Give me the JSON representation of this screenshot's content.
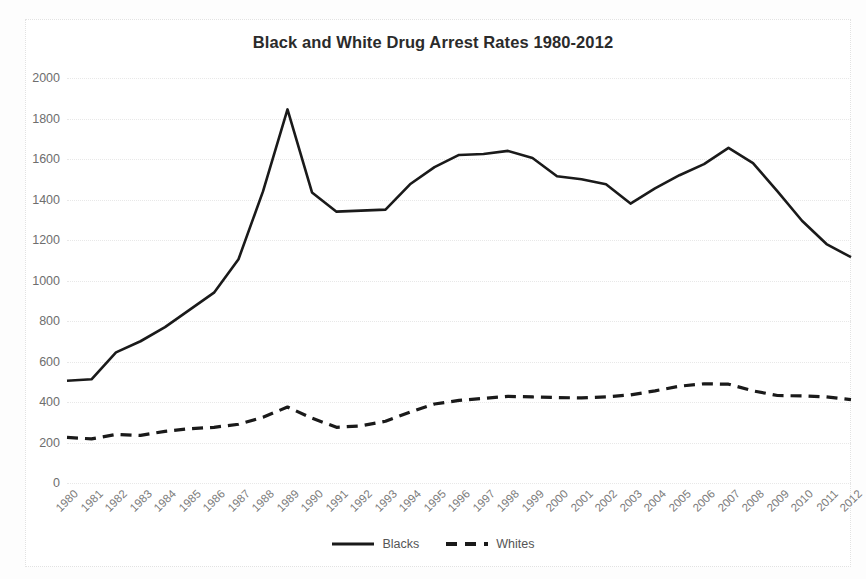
{
  "chart_data": {
    "type": "line",
    "title": "Black and White Drug Arrest Rates 1980-2012",
    "xlabel": "",
    "ylabel": "",
    "ylim": [
      0,
      2000
    ],
    "ytick_step": 200,
    "yticks": [
      "2000",
      "1800",
      "1600",
      "1400",
      "1200",
      "1000",
      "800",
      "600",
      "400",
      "200",
      "0"
    ],
    "grid": true,
    "legend_position": "bottom",
    "categories": [
      "1980",
      "1981",
      "1982",
      "1983",
      "1984",
      "1985",
      "1986",
      "1987",
      "1988",
      "1989",
      "1990",
      "1991",
      "1992",
      "1993",
      "1994",
      "1995",
      "1996",
      "1997",
      "1998",
      "1999",
      "2000",
      "2001",
      "2002",
      "2003",
      "2004",
      "2005",
      "2006",
      "2007",
      "2008",
      "2009",
      "2010",
      "2011",
      "2012"
    ],
    "series": [
      {
        "name": "Blacks",
        "style": "solid",
        "color": "#1a1a1a",
        "values": [
          505,
          512,
          645,
          700,
          770,
          855,
          940,
          1105,
          1440,
          1845,
          1435,
          1340,
          1345,
          1350,
          1475,
          1560,
          1620,
          1625,
          1640,
          1605,
          1515,
          1500,
          1475,
          1380,
          1455,
          1520,
          1575,
          1655,
          1580,
          1440,
          1295,
          1180,
          1115
        ]
      },
      {
        "name": "Whites",
        "style": "dashed",
        "color": "#1a1a1a",
        "values": [
          225,
          218,
          240,
          235,
          255,
          268,
          275,
          290,
          325,
          375,
          320,
          275,
          282,
          305,
          350,
          390,
          408,
          418,
          428,
          425,
          422,
          420,
          425,
          435,
          455,
          478,
          490,
          488,
          455,
          432,
          430,
          425,
          412
        ]
      }
    ]
  },
  "legend": {
    "items": [
      {
        "label": "Blacks",
        "style": "solid"
      },
      {
        "label": "Whites",
        "style": "dashed"
      }
    ]
  }
}
